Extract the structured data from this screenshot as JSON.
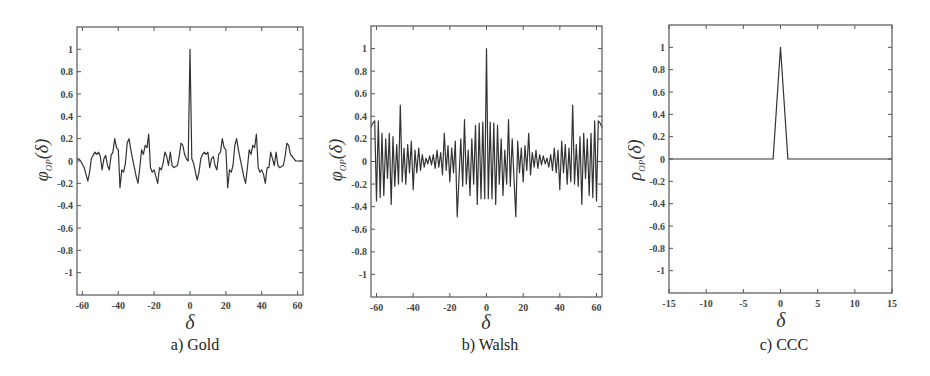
{
  "figure": {
    "panels": [
      {
        "caption": "a) Gold",
        "ylabel_symbol": "φ",
        "ylabel_sub": "OP",
        "ylabel_arg": "(δ)",
        "xlabel": "δ"
      },
      {
        "caption": "b) Walsh",
        "ylabel_symbol": "φ",
        "ylabel_sub": "OP",
        "ylabel_arg": "(δ)",
        "xlabel": "δ"
      },
      {
        "caption": "c) CCC",
        "ylabel_symbol": "ρ",
        "ylabel_sub": "OP",
        "ylabel_arg": "(δ)",
        "xlabel": "δ"
      }
    ]
  },
  "chart_data": [
    {
      "type": "line",
      "title": "a) Gold",
      "xlabel": "δ",
      "ylabel": "φ_OP(δ)",
      "xlim": [
        -63,
        63
      ],
      "ylim": [
        -1.2,
        1.2
      ],
      "xticks": [
        -60,
        -40,
        -20,
        0,
        20,
        40,
        60
      ],
      "yticks": [
        1,
        0.8,
        0.6,
        0.4,
        0.2,
        0,
        -0.2,
        -0.4,
        -0.6,
        -0.8,
        -1
      ],
      "grid": false,
      "x": [
        -63,
        -62,
        -61,
        -60,
        -59,
        -58,
        -57,
        -56,
        -55,
        -54,
        -53,
        -52,
        -51,
        -50,
        -49,
        -48,
        -47,
        -46,
        -45,
        -44,
        -43,
        -42,
        -41,
        -40,
        -39,
        -38,
        -37,
        -36,
        -35,
        -34,
        -33,
        -32,
        -31,
        -30,
        -29,
        -28,
        -27,
        -26,
        -25,
        -24,
        -23,
        -22,
        -21,
        -20,
        -19,
        -18,
        -17,
        -16,
        -15,
        -14,
        -13,
        -12,
        -11,
        -10,
        -9,
        -8,
        -7,
        -6,
        -5,
        -4,
        -3,
        -2,
        -1,
        0,
        1,
        2,
        3,
        4,
        5,
        6,
        7,
        8,
        9,
        10,
        11,
        12,
        13,
        14,
        15,
        16,
        17,
        18,
        19,
        20,
        21,
        22,
        23,
        24,
        25,
        26,
        27,
        28,
        29,
        30,
        31,
        32,
        33,
        34,
        35,
        36,
        37,
        38,
        39,
        40,
        41,
        42,
        43,
        44,
        45,
        46,
        47,
        48,
        49,
        50,
        51,
        52,
        53,
        54,
        55,
        56,
        57,
        58,
        59,
        60,
        61,
        62,
        63
      ],
      "values": [
        0.02,
        0.02,
        0,
        -0.03,
        -0.06,
        -0.12,
        -0.18,
        -0.1,
        0.02,
        0.05,
        0.08,
        0.06,
        0.08,
        0.04,
        -0.08,
        0.02,
        0.05,
        -0.04,
        -0.08,
        0.05,
        0.08,
        0.2,
        0.12,
        0.1,
        -0.24,
        -0.08,
        -0.1,
        -0.02,
        0.16,
        0.2,
        0.1,
        0.02,
        -0.06,
        -0.14,
        -0.2,
        -0.06,
        0.1,
        0.06,
        0.14,
        0.12,
        0.24,
        -0.06,
        -0.1,
        -0.08,
        -0.14,
        -0.2,
        -0.06,
        -0.08,
        -0.02,
        0.08,
        0.04,
        -0.04,
        0.08,
        -0.04,
        -0.06,
        -0.05,
        -0.04,
        0.04,
        0.16,
        0.14,
        0.06,
        0.02,
        0,
        1,
        0.02,
        -0.02,
        -0.1,
        -0.17,
        -0.1,
        0.02,
        0.06,
        0.08,
        0.06,
        0.08,
        -0.06,
        0.02,
        0.04,
        -0.04,
        -0.08,
        0.06,
        0.08,
        0.2,
        0.12,
        0.1,
        -0.24,
        -0.08,
        -0.1,
        -0.04,
        0.14,
        0.2,
        0.1,
        0.02,
        -0.06,
        -0.14,
        -0.2,
        -0.06,
        0.1,
        0.06,
        0.14,
        0.12,
        0.24,
        -0.06,
        -0.1,
        -0.08,
        -0.12,
        -0.2,
        -0.06,
        -0.06,
        0.08,
        0.02,
        -0.04,
        0.08,
        -0.04,
        -0.06,
        -0.05,
        -0.04,
        0.04,
        0.16,
        0.14,
        0.06,
        0.04,
        0.02,
        0,
        0,
        0,
        0,
        0
      ]
    },
    {
      "type": "line",
      "title": "b) Walsh",
      "xlabel": "δ",
      "ylabel": "φ_OP(δ)",
      "xlim": [
        -63,
        63
      ],
      "ylim": [
        -1.2,
        1.2
      ],
      "xticks": [
        -60,
        -40,
        -20,
        0,
        20,
        40,
        60
      ],
      "yticks": [
        1,
        0.8,
        0.6,
        0.4,
        0.2,
        0,
        -0.2,
        -0.4,
        -0.6,
        -0.8,
        -1
      ],
      "grid": false,
      "x": [
        -63,
        -62,
        -61,
        -60,
        -59,
        -58,
        -57,
        -56,
        -55,
        -54,
        -53,
        -52,
        -51,
        -50,
        -49,
        -48,
        -47,
        -46,
        -45,
        -44,
        -43,
        -42,
        -41,
        -40,
        -39,
        -38,
        -37,
        -36,
        -35,
        -34,
        -33,
        -32,
        -31,
        -30,
        -29,
        -28,
        -27,
        -26,
        -25,
        -24,
        -23,
        -22,
        -21,
        -20,
        -19,
        -18,
        -17,
        -16,
        -15,
        -14,
        -13,
        -12,
        -11,
        -10,
        -9,
        -8,
        -7,
        -6,
        -5,
        -4,
        -3,
        -2,
        -1,
        0,
        1,
        2,
        3,
        4,
        5,
        6,
        7,
        8,
        9,
        10,
        11,
        12,
        13,
        14,
        15,
        16,
        17,
        18,
        19,
        20,
        21,
        22,
        23,
        24,
        25,
        26,
        27,
        28,
        29,
        30,
        31,
        32,
        33,
        34,
        35,
        36,
        37,
        38,
        39,
        40,
        41,
        42,
        43,
        44,
        45,
        46,
        47,
        48,
        49,
        50,
        51,
        52,
        53,
        54,
        55,
        56,
        57,
        58,
        59,
        60,
        61,
        62,
        63
      ],
      "values": [
        0.3,
        0.34,
        0.36,
        -0.35,
        0.36,
        -0.32,
        0.25,
        -0.3,
        0.2,
        -0.15,
        0.25,
        -0.38,
        0.22,
        -0.22,
        0.15,
        -0.2,
        0.5,
        -0.18,
        0.12,
        -0.2,
        0.15,
        -0.1,
        0.18,
        -0.25,
        0.1,
        -0.1,
        0.12,
        -0.08,
        0.06,
        -0.05,
        0.03,
        -0.02,
        0.05,
        -0.03,
        0.06,
        -0.06,
        0.1,
        -0.05,
        0.08,
        -0.12,
        0.25,
        -0.08,
        0.14,
        -0.18,
        0.12,
        -0.1,
        0.18,
        -0.49,
        -0.15,
        0.2,
        -0.22,
        0.37,
        -0.2,
        0.1,
        -0.3,
        0.2,
        -0.2,
        0.32,
        -0.38,
        0.34,
        -0.33,
        0.35,
        -0.33,
        1,
        -0.33,
        0.35,
        -0.33,
        0.34,
        -0.38,
        0.32,
        -0.2,
        0.2,
        -0.3,
        0.1,
        -0.2,
        0.37,
        -0.22,
        0.2,
        -0.15,
        -0.49,
        0.18,
        -0.1,
        0.12,
        -0.18,
        0.14,
        -0.08,
        0.25,
        -0.12,
        0.08,
        -0.05,
        0.1,
        -0.06,
        0.06,
        -0.03,
        0.05,
        -0.02,
        0.03,
        -0.05,
        0.06,
        -0.08,
        0.12,
        -0.1,
        0.1,
        -0.25,
        0.18,
        -0.1,
        0.15,
        -0.2,
        0.12,
        -0.18,
        0.5,
        -0.2,
        0.15,
        -0.22,
        0.22,
        -0.38,
        0.25,
        -0.15,
        0.2,
        -0.3,
        0.25,
        -0.32,
        0.36,
        -0.35,
        0.36,
        0.34,
        0.3
      ]
    },
    {
      "type": "line",
      "title": "c) CCC",
      "xlabel": "δ",
      "ylabel": "ρ_OP(δ)",
      "xlim": [
        -15,
        15
      ],
      "ylim": [
        -1.2,
        1.2
      ],
      "xticks": [
        -15,
        -10,
        -5,
        0,
        5,
        10,
        15
      ],
      "yticks": [
        1,
        0.8,
        0.6,
        0.4,
        0.2,
        0,
        -0.2,
        -0.4,
        -0.6,
        -0.8,
        -1
      ],
      "grid": false,
      "x": [
        -15,
        -14,
        -13,
        -12,
        -11,
        -10,
        -9,
        -8,
        -7,
        -6,
        -5,
        -4,
        -3,
        -2,
        -1,
        0,
        1,
        2,
        3,
        4,
        5,
        6,
        7,
        8,
        9,
        10,
        11,
        12,
        13,
        14,
        15
      ],
      "values": [
        0,
        0,
        0,
        0,
        0,
        0,
        0,
        0,
        0,
        0,
        0,
        0,
        0,
        0,
        0,
        1,
        0,
        0,
        0,
        0,
        0,
        0,
        0,
        0,
        0,
        0,
        0,
        0,
        0,
        0,
        0
      ]
    }
  ]
}
